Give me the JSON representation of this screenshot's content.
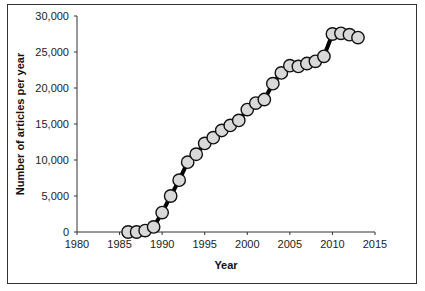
{
  "chart_data": {
    "type": "line",
    "title": "",
    "xlabel": "Year",
    "ylabel": "Number of articles per year",
    "xlim": [
      1980,
      2015
    ],
    "ylim": [
      0,
      30000
    ],
    "x_ticks": [
      "1980",
      "1985",
      "1990",
      "1995",
      "2000",
      "2005",
      "2010",
      "2015"
    ],
    "y_ticks": [
      "0",
      "5,000",
      "10,000",
      "15,000",
      "20,000",
      "25,000",
      "30,000"
    ],
    "grid": false,
    "legend": null,
    "marker": "circle",
    "marker_fill": "#d9d9d9",
    "line_color": "#000000",
    "series": [
      {
        "name": "Articles per year",
        "x": [
          1986,
          1987,
          1988,
          1989,
          1990,
          1991,
          1992,
          1993,
          1994,
          1995,
          1996,
          1997,
          1998,
          1999,
          2000,
          2001,
          2002,
          2003,
          2004,
          2005,
          2006,
          2007,
          2008,
          2009,
          2010,
          2011,
          2012,
          2013
        ],
        "values": [
          0,
          0,
          200,
          700,
          2700,
          5000,
          7200,
          9700,
          10800,
          12300,
          13100,
          14100,
          14800,
          15500,
          17000,
          17900,
          18400,
          20600,
          22100,
          23100,
          23000,
          23400,
          23700,
          24400,
          27500,
          27600,
          27400,
          27000
        ]
      }
    ]
  }
}
